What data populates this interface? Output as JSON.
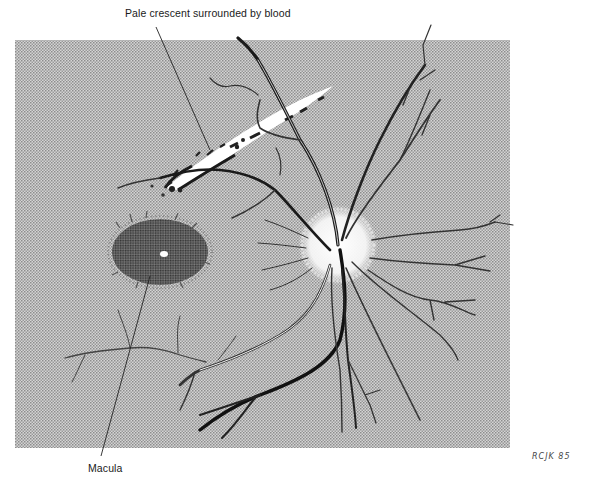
{
  "figure": {
    "type": "medical-illustration",
    "background_color": "#c8c8c8",
    "halftone_dark": "#8a8a8a",
    "halftone_light": "#d8d8d8"
  },
  "labels": {
    "crescent": "Pale crescent surrounded by blood",
    "macula": "Macula"
  },
  "signature": "RCJK 85",
  "features": [
    {
      "name": "pale-crescent",
      "description": "white crescent region bordered by dark blood"
    },
    {
      "name": "macula",
      "description": "dark stippled oval with central white reflex"
    },
    {
      "name": "optic-disc",
      "description": "pale disc with radiating retinal vessels"
    }
  ]
}
